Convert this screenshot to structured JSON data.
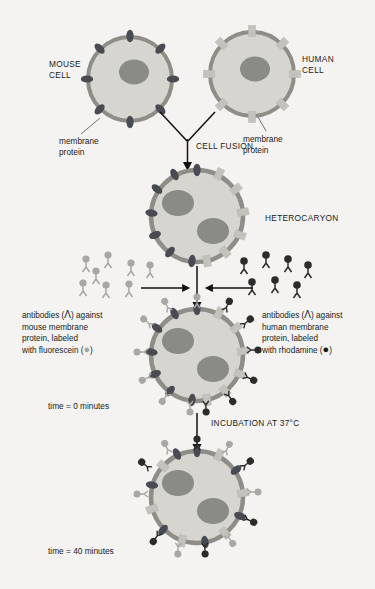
{
  "figure": {
    "background_color": "#f4f3f1"
  },
  "labels": {
    "mouse_cell": "MOUSE\nCELL",
    "mouse_cell_line1": "MOUSE",
    "mouse_cell_line2": "CELL",
    "human_cell_line1": "HUMAN",
    "human_cell_line2": "CELL",
    "membrane_protein_left_line1": "membrane",
    "membrane_protein_left_line2": "protein",
    "membrane_protein_right_line1": "membrane",
    "membrane_protein_right_line2": "protein",
    "cell_fusion": "CELL FUSION",
    "heterocaryon": "HETEROCARYON",
    "incubation": "INCUBATION AT 37°C",
    "time_zero": "time = 0 minutes",
    "time_forty": "time = 40 minutes"
  },
  "antibody_left": {
    "line1": "antibodies (",
    "line1b": ") against",
    "line2": "mouse membrane",
    "line3": "protein, labeled",
    "line4": "with fluorescein (",
    "line4b": ")"
  },
  "antibody_right": {
    "line1": "antibodies (",
    "line1b": ") against",
    "line2": "human membrane",
    "line3": "protein, labeled",
    "line4": "with rhodamine (",
    "line4b": ")"
  },
  "colors": {
    "background": "#f4f3f1",
    "cytoplasm": "#d6d5d0",
    "membrane": "#8e8d88",
    "nucleus": "#8a8a87",
    "mouse_protein": "#4a4a52",
    "human_protein": "#c3c2bd",
    "fluorescein_label": "#a8a7a2",
    "rhodamine_label": "#2b2b2b",
    "text": "#1a1a1a"
  },
  "icons": {
    "antibody_glyph": "antibody-y-icon",
    "fluorescein_dot": "fluorescein-circle-icon",
    "rhodamine_dot": "rhodamine-circle-icon"
  },
  "cells": {
    "mouse": {
      "name": "mouse-cell",
      "protein_count": 8,
      "protein_type": "dark-oval"
    },
    "human": {
      "name": "human-cell",
      "protein_count": 8,
      "protein_type": "light-rect"
    },
    "heterocaryon": {
      "name": "heterocaryon-cell",
      "nuclei": 2
    },
    "time0": {
      "name": "heterocaryon-time-0",
      "nuclei": 2,
      "state": "segregated"
    },
    "time40": {
      "name": "heterocaryon-time-40",
      "nuclei": 2,
      "state": "intermixed"
    }
  }
}
